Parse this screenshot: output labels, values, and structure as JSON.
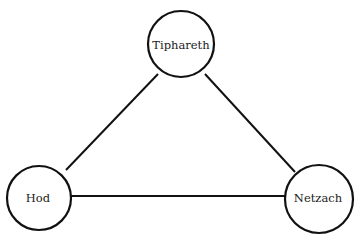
{
  "diagram": {
    "type": "graph",
    "nodes": [
      {
        "id": "tiphareth",
        "label": "Tiphareth",
        "cx": 181,
        "cy": 44,
        "r": 33
      },
      {
        "id": "hod",
        "label": "Hod",
        "cx": 39,
        "cy": 198,
        "r": 32
      },
      {
        "id": "netzach",
        "label": "Netzach",
        "cx": 319,
        "cy": 199,
        "r": 34
      }
    ],
    "edges": [
      {
        "from": "hod",
        "to": "tiphareth"
      },
      {
        "from": "tiphareth",
        "to": "netzach"
      },
      {
        "from": "hod",
        "to": "netzach"
      }
    ],
    "colors": {
      "stroke": "#111111",
      "fill": "#ffffff",
      "text": "#222222"
    }
  }
}
